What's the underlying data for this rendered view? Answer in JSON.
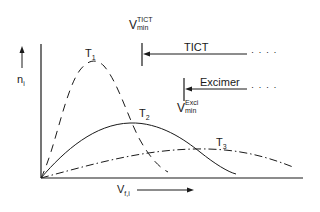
{
  "diagram": {
    "y_axis_label": {
      "main": "n",
      "sub": "i"
    },
    "x_axis_label": {
      "main": "V",
      "sub": "f,i"
    },
    "curves": [
      {
        "label": "T",
        "sub": "1",
        "style": "dashed",
        "peak": [
          92,
          62
        ]
      },
      {
        "label": "T",
        "sub": "2",
        "style": "solid",
        "peak": [
          130,
          123
        ]
      },
      {
        "label": "T",
        "sub": "3",
        "style": "dash-dot",
        "peak": [
          195,
          149
        ]
      }
    ],
    "thresholds": [
      {
        "name": "TICT",
        "label": "TICT",
        "v_main": "V",
        "v_sup": "TICT",
        "v_sub": "min"
      },
      {
        "name": "Excimer",
        "label": "Excimer",
        "v_main": "V",
        "v_sup": "Exci",
        "v_sub": "min"
      }
    ],
    "trailing_dots": "· · · ·"
  }
}
